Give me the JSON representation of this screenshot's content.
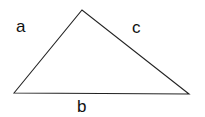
{
  "diagram": {
    "type": "triangle",
    "stroke_color": "#222222",
    "background": "#ffffff",
    "vertices": {
      "left": [
        14,
        93
      ],
      "top": [
        82,
        10
      ],
      "right": [
        189,
        94
      ]
    },
    "labels": {
      "a": "a",
      "b": "b",
      "c": "c"
    }
  }
}
